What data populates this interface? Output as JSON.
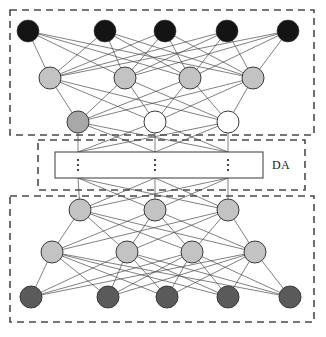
{
  "diagram": {
    "canvas": {
      "width": 326,
      "height": 337,
      "background": "#ffffff"
    },
    "labels": {
      "da": {
        "text": "DA",
        "x": 272,
        "y": 158
      }
    },
    "colors": {
      "node_black": "#141414",
      "node_gray_light": "#c3c3c3",
      "node_gray_mid": "#a8a8a8",
      "node_gray_dark": "#5a5a5a",
      "node_white": "#ffffff",
      "node_stroke": "#3a3a3a",
      "edge": "#4a4a4a",
      "dashed_border": "#4a4a4a",
      "solid_border": "#4a4a4a"
    },
    "dashed_boxes": [
      {
        "name": "top-block",
        "x": 10,
        "y": 10,
        "width": 304,
        "height": 125
      },
      {
        "name": "middle-block",
        "x": 38,
        "y": 140,
        "width": 267,
        "height": 50
      },
      {
        "name": "bottom-block",
        "x": 10,
        "y": 196,
        "width": 304,
        "height": 126
      }
    ],
    "code_box": {
      "name": "code-layer-box",
      "x": 55,
      "y": 152,
      "width": 208,
      "height": 26
    },
    "ellipses": [
      {
        "x": 78,
        "y": 165
      },
      {
        "x": 155,
        "y": 165
      },
      {
        "x": 228,
        "y": 165
      }
    ],
    "node_radius": 11,
    "layers": [
      {
        "name": "top-input-layer",
        "fill_key": "node_black",
        "y": 31,
        "x": [
          28,
          105,
          165,
          227,
          288
        ]
      },
      {
        "name": "top-hidden-layer",
        "fill_key": "node_gray_light",
        "y": 78,
        "x": [
          50,
          125,
          190,
          253
        ]
      },
      {
        "name": "top-code-layer",
        "fill_key": "mixed",
        "y": 122,
        "x": [
          78,
          155,
          228
        ],
        "fills": [
          "node_gray_mid",
          "node_white",
          "node_white"
        ]
      },
      {
        "name": "bottom-code-layer",
        "fill_key": "node_gray_light",
        "y": 210,
        "x": [
          80,
          155,
          228
        ]
      },
      {
        "name": "bottom-hidden-layer",
        "fill_key": "node_gray_light",
        "y": 252,
        "x": [
          52,
          127,
          192,
          255
        ]
      },
      {
        "name": "bottom-output-layer",
        "fill_key": "node_gray_dark",
        "y": 297,
        "x": [
          31,
          108,
          167,
          228,
          290
        ]
      }
    ],
    "connections": [
      {
        "from": "top-input-layer",
        "to": "top-hidden-layer"
      },
      {
        "from": "top-hidden-layer",
        "to": "top-code-layer"
      },
      {
        "from": "top-code-layer",
        "to": "code-box-top"
      },
      {
        "from": "code-box-bottom",
        "to": "bottom-code-layer"
      },
      {
        "from": "bottom-code-layer",
        "to": "bottom-hidden-layer"
      },
      {
        "from": "bottom-hidden-layer",
        "to": "bottom-output-layer"
      }
    ]
  }
}
